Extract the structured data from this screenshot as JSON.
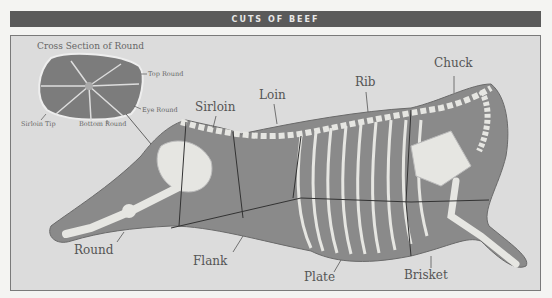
{
  "title": "CUTS OF BEEF",
  "cross_section": {
    "title": "Cross Section of Round",
    "labels": {
      "top_round": "Top Round",
      "eye_round": "Eye Round",
      "sirloin_tip": "Sirloin Tip",
      "bottom_round": "Bottom Round"
    }
  },
  "cuts": {
    "sirloin": "Sirloin",
    "loin": "Loin",
    "rib": "Rib",
    "chuck": "Chuck",
    "round": "Round",
    "flank": "Flank",
    "plate": "Plate",
    "brisket": "Brisket"
  },
  "colors": {
    "title_bar": "#5a5a5a",
    "panel_bg": "#dcdcdc",
    "carcass": "#8a8a8a",
    "bone": "#e6e6e2",
    "cut_lines": "#333333"
  }
}
